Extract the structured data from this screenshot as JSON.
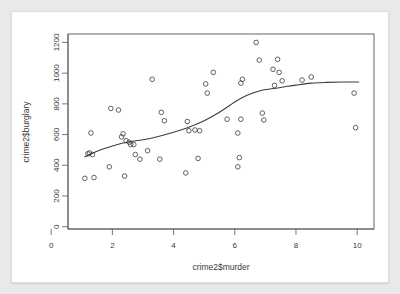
{
  "chart_data": {
    "type": "scatter",
    "title": "",
    "xlabel": "crime2$murder",
    "ylabel": "crime2$burglary",
    "xlim": [
      0.55,
      10.55
    ],
    "ylim": [
      -15,
      1255
    ],
    "xticks": [
      0,
      2,
      4,
      6,
      8,
      10
    ],
    "yticks": [
      0,
      200,
      400,
      600,
      800,
      1000,
      1200
    ],
    "xtick_labels": [
      "0",
      "2",
      "4",
      "6",
      "8",
      "10"
    ],
    "ytick_labels": [
      "0",
      "200",
      "400",
      "600",
      "800",
      "1000",
      "1200"
    ],
    "grid": false,
    "legend": null,
    "marker": "open-circle",
    "points": [
      {
        "x": 1.1,
        "y": 315
      },
      {
        "x": 1.2,
        "y": 475
      },
      {
        "x": 1.25,
        "y": 480
      },
      {
        "x": 1.3,
        "y": 610
      },
      {
        "x": 1.35,
        "y": 470
      },
      {
        "x": 1.4,
        "y": 320
      },
      {
        "x": 1.9,
        "y": 390
      },
      {
        "x": 1.95,
        "y": 770
      },
      {
        "x": 2.2,
        "y": 760
      },
      {
        "x": 2.3,
        "y": 585
      },
      {
        "x": 2.35,
        "y": 605
      },
      {
        "x": 2.4,
        "y": 330
      },
      {
        "x": 2.45,
        "y": 560
      },
      {
        "x": 2.55,
        "y": 550
      },
      {
        "x": 2.6,
        "y": 535
      },
      {
        "x": 2.7,
        "y": 535
      },
      {
        "x": 2.75,
        "y": 470
      },
      {
        "x": 2.9,
        "y": 440
      },
      {
        "x": 3.15,
        "y": 495
      },
      {
        "x": 3.3,
        "y": 960
      },
      {
        "x": 3.55,
        "y": 440
      },
      {
        "x": 3.6,
        "y": 745
      },
      {
        "x": 3.7,
        "y": 690
      },
      {
        "x": 4.4,
        "y": 350
      },
      {
        "x": 4.45,
        "y": 685
      },
      {
        "x": 4.5,
        "y": 625
      },
      {
        "x": 4.7,
        "y": 630
      },
      {
        "x": 4.8,
        "y": 445
      },
      {
        "x": 4.85,
        "y": 625
      },
      {
        "x": 5.05,
        "y": 930
      },
      {
        "x": 5.1,
        "y": 870
      },
      {
        "x": 5.3,
        "y": 1005
      },
      {
        "x": 5.75,
        "y": 700
      },
      {
        "x": 6.1,
        "y": 390
      },
      {
        "x": 6.15,
        "y": 450
      },
      {
        "x": 6.1,
        "y": 610
      },
      {
        "x": 6.2,
        "y": 700
      },
      {
        "x": 6.2,
        "y": 935
      },
      {
        "x": 6.25,
        "y": 960
      },
      {
        "x": 6.7,
        "y": 1200
      },
      {
        "x": 6.8,
        "y": 1085
      },
      {
        "x": 6.9,
        "y": 740
      },
      {
        "x": 6.95,
        "y": 695
      },
      {
        "x": 7.25,
        "y": 1025
      },
      {
        "x": 7.3,
        "y": 920
      },
      {
        "x": 7.4,
        "y": 1090
      },
      {
        "x": 7.45,
        "y": 1005
      },
      {
        "x": 7.55,
        "y": 950
      },
      {
        "x": 8.2,
        "y": 955
      },
      {
        "x": 8.5,
        "y": 975
      },
      {
        "x": 9.9,
        "y": 870
      },
      {
        "x": 9.95,
        "y": 645
      }
    ],
    "smooth_line": {
      "name": "lowess",
      "x": [
        1.1,
        1.5,
        2.0,
        2.5,
        3.0,
        3.5,
        4.0,
        4.5,
        5.0,
        5.5,
        6.0,
        6.4,
        6.8,
        7.2,
        7.6,
        8.0,
        8.5,
        9.0,
        9.5,
        10.05
      ],
      "y": [
        455,
        492,
        525,
        551,
        566,
        588,
        615,
        648,
        690,
        745,
        812,
        856,
        884,
        898,
        910,
        922,
        935,
        940,
        942,
        942
      ]
    }
  }
}
